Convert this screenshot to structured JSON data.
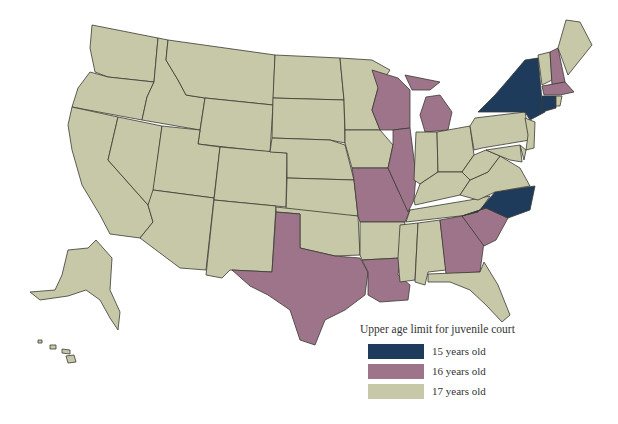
{
  "map": {
    "title": "Upper age limit for juvenile court",
    "colors": {
      "age15": "#1f3b5c",
      "age16": "#9d7489",
      "age17": "#c6c8a8",
      "border": "#3a3a32"
    },
    "legend": [
      {
        "label": "15 years old",
        "color": "#1f3b5c"
      },
      {
        "label": "16 years old",
        "color": "#9d7489"
      },
      {
        "label": "17 years old",
        "color": "#c6c8a8"
      }
    ],
    "states": {
      "15": [
        "New York",
        "Connecticut",
        "North Carolina"
      ],
      "16": [
        "Wisconsin",
        "Michigan",
        "Illinois",
        "Missouri",
        "Texas",
        "Louisiana",
        "Georgia",
        "South Carolina",
        "New Hampshire",
        "Massachusetts"
      ],
      "17": [
        "Washington",
        "Oregon",
        "California",
        "Nevada",
        "Idaho",
        "Montana",
        "Wyoming",
        "Utah",
        "Arizona",
        "Colorado",
        "New Mexico",
        "North Dakota",
        "South Dakota",
        "Nebraska",
        "Kansas",
        "Oklahoma",
        "Minnesota",
        "Iowa",
        "Arkansas",
        "Mississippi",
        "Alabama",
        "Tennessee",
        "Kentucky",
        "Indiana",
        "Ohio",
        "West Virginia",
        "Virginia",
        "Pennsylvania",
        "New Jersey",
        "Delaware",
        "Maryland",
        "Florida",
        "Vermont",
        "Maine",
        "Rhode Island",
        "Alaska",
        "Hawaii"
      ]
    }
  }
}
